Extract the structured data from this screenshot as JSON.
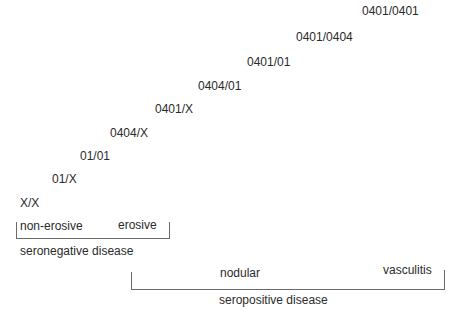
{
  "genotypes": [
    {
      "label": "X/X",
      "x": 20,
      "y": 196
    },
    {
      "label": "01/X",
      "x": 52,
      "y": 172
    },
    {
      "label": "01/01",
      "x": 80,
      "y": 149
    },
    {
      "label": "0404/X",
      "x": 110,
      "y": 126
    },
    {
      "label": "0401/X",
      "x": 155,
      "y": 102
    },
    {
      "label": "0404/01",
      "x": 198,
      "y": 79
    },
    {
      "label": "0401/01",
      "x": 247,
      "y": 55
    },
    {
      "label": "0401/0404",
      "x": 296,
      "y": 30
    },
    {
      "label": "0401/0401",
      "x": 362,
      "y": 4
    }
  ],
  "seronegative": {
    "left_label": "non-erosive",
    "right_label": "erosive",
    "group_label": "seronegative disease"
  },
  "seropositive": {
    "left_label": "nodular",
    "right_label": "vasculitis",
    "group_label": "seropositive disease"
  }
}
